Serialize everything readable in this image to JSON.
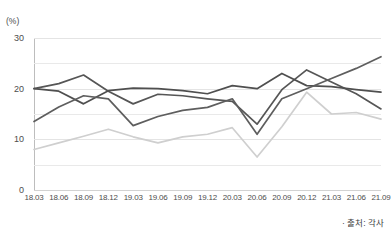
{
  "chart_data": {
    "type": "line",
    "title": "",
    "xlabel": "",
    "ylabel": "(%)",
    "ylim": [
      0,
      30
    ],
    "yticks": [
      0,
      10,
      20,
      30
    ],
    "yticklabels": [
      "0",
      "10",
      "20",
      "30"
    ],
    "minor_gridlines": [
      5,
      15,
      25
    ],
    "grid": true,
    "legend": "none",
    "categories": [
      "18.03",
      "18.06",
      "18.09",
      "18.12",
      "19.03",
      "19.06",
      "19.09",
      "19.12",
      "20.03",
      "20.06",
      "20.09",
      "20.12",
      "21.03",
      "21.06",
      "21.09"
    ],
    "series": [
      {
        "name": "series-1",
        "color": "#565656",
        "values": [
          20.0,
          21.0,
          22.7,
          19.5,
          17.0,
          18.9,
          18.6,
          18.0,
          17.5,
          13.0,
          19.8,
          23.7,
          21.3,
          19.0,
          16.0
        ]
      },
      {
        "name": "series-2",
        "color": "#4f4f4f",
        "values": [
          20.0,
          19.5,
          17.0,
          19.6,
          20.1,
          20.0,
          19.6,
          19.0,
          20.6,
          20.0,
          23.0,
          20.6,
          20.4,
          19.8,
          19.3
        ]
      },
      {
        "name": "series-3",
        "color": "#5e5e5e",
        "values": [
          13.5,
          16.4,
          18.6,
          18.0,
          12.7,
          14.5,
          15.7,
          16.3,
          18.0,
          11.0,
          18.0,
          20.0,
          22.0,
          24.0,
          26.3
        ]
      },
      {
        "name": "series-4",
        "color": "#cfcfcf",
        "values": [
          8.0,
          9.3,
          10.6,
          12.0,
          10.5,
          9.3,
          10.5,
          11.0,
          12.3,
          6.5,
          12.5,
          19.3,
          15.0,
          15.3,
          14.0
        ]
      }
    ]
  },
  "footer": {
    "source_note": "· 출처: 각사"
  },
  "axis": {
    "unit_label": "(%)"
  }
}
